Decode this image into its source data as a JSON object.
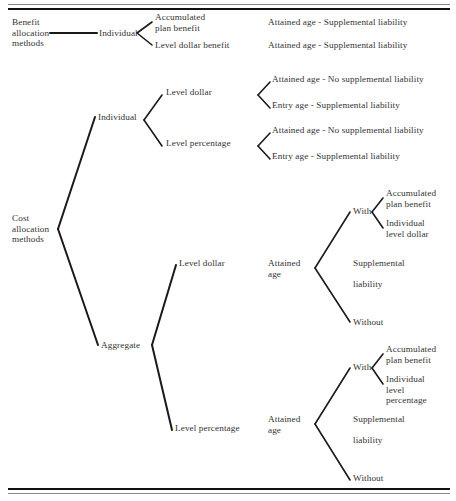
{
  "figure": {
    "type": "tree-diagram",
    "top_rule": true,
    "bottom_rule": true
  },
  "benefit": {
    "root": "Benefit\nallocation\nmethods",
    "level1": "Individual",
    "branches": [
      {
        "label": "Accumulated\nplan benefit",
        "result": "Attained age - Supplemental liability"
      },
      {
        "label": "Level dollar benefit",
        "result": "Attained age - Supplemental liability"
      }
    ]
  },
  "cost": {
    "root": "Cost\nallocation\nmethods",
    "individual": {
      "label": "Individual",
      "branches": [
        {
          "label": "Level dollar",
          "results": [
            "Attained age - No supplemental liability",
            "Entry age - Supplemental liability"
          ]
        },
        {
          "label": "Level percentage",
          "results": [
            "Attained age - No supplemental liability",
            "Entry age - Supplemental liability"
          ]
        }
      ]
    },
    "aggregate": {
      "label": "Aggregate",
      "branches": [
        {
          "label": "Level dollar",
          "age": "Attained\nage",
          "with_label": "With",
          "with_items": [
            "Accumulated\nplan benefit",
            "Individual\nlevel dollar"
          ],
          "supplemental": "Supplemental\n\nliability",
          "without_label": "Without"
        },
        {
          "label": "Level percentage",
          "age": "Attained\nage",
          "with_label": "With",
          "with_items": [
            "Accumulated\nplan benefit",
            "Individual\nlevel\npercentage"
          ],
          "supplemental": "Supplemental\n\nliability",
          "without_label": "Without"
        }
      ]
    }
  },
  "colors": {
    "line": "#1a1a1a",
    "text": "#333333",
    "rule": "#111111",
    "background": "#ffffff"
  }
}
